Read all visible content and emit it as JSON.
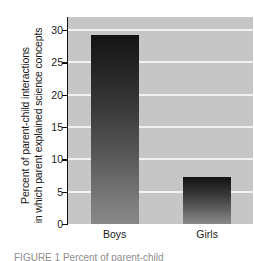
{
  "chart_data": {
    "type": "bar",
    "title": "",
    "subtitle": "",
    "xlabel": "",
    "ylabel_lines": [
      "Percent of parent-child interactions",
      "in which parent explained science concepts"
    ],
    "ylabel": "Percent of parent-child interactions in which parent explained science concepts",
    "categories": [
      "Boys",
      "Girls"
    ],
    "values": [
      29.2,
      7.2
    ],
    "ylim": [
      0,
      32
    ],
    "yticks": [
      0,
      5,
      10,
      15,
      20,
      25,
      30
    ],
    "ytick_labels": [
      "0",
      "5",
      "10",
      "15",
      "20",
      "25",
      "30"
    ],
    "gridlines": true,
    "gridline_color": "#f2f2f2",
    "legend": "none",
    "plot_background": "#c6c6c6",
    "bar_gradient_top": "#141414",
    "bar_gradient_bottom": "#888888",
    "axis_color": "#111111"
  },
  "caption": {
    "clipped_text": "FIGURE 1 Percent of parent-child"
  }
}
